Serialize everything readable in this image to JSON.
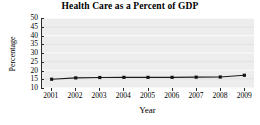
{
  "chart_data": {
    "type": "line",
    "title": "Health Care as a Percent of GDP",
    "xlabel": "Year",
    "ylabel": "Percentage",
    "categories": [
      "2001",
      "2002",
      "2003",
      "2004",
      "2005",
      "2006",
      "2007",
      "2008",
      "2009"
    ],
    "x": [
      2001,
      2002,
      2003,
      2004,
      2005,
      2006,
      2007,
      2008,
      2009
    ],
    "values": [
      14.5,
      15.3,
      15.5,
      15.6,
      15.6,
      15.6,
      15.7,
      15.8,
      16.8
    ],
    "series": [
      {
        "name": "Health Care as a Percent of GDP",
        "values": [
          14.5,
          15.3,
          15.5,
          15.6,
          15.6,
          15.6,
          15.7,
          15.8,
          16.8
        ]
      }
    ],
    "ylim": [
      10,
      50
    ],
    "xlim": [
      2000.6,
      2009.4
    ],
    "yticks": [
      10,
      15,
      20,
      25,
      30,
      35,
      40,
      45,
      50
    ],
    "ytick_labels": [
      "10",
      "15",
      "20",
      "25",
      "30",
      "35",
      "40",
      "45",
      "50"
    ],
    "xticks": [
      2001,
      2002,
      2003,
      2004,
      2005,
      2006,
      2007,
      2008,
      2009
    ],
    "xtick_labels": [
      "2001",
      "2002",
      "2003",
      "2004",
      "2005",
      "2006",
      "2007",
      "2008",
      "2009"
    ],
    "grid": true,
    "grid_axis": "y",
    "legend": false,
    "legend_position": "none",
    "marker": "square",
    "colors": {
      "line": "#1c1c1c",
      "marker": "#141414",
      "plot_background": "#ededed",
      "gridline": "#fbfbfb",
      "axis": "#2b2b2b",
      "text": "#000000",
      "page_background": "#ffffff"
    }
  }
}
